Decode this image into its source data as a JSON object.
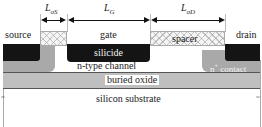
{
  "diagram": {
    "title": "",
    "dimensions": {
      "L_oS": {
        "label": "L",
        "subscript": "oS"
      },
      "L_G": {
        "label": "L",
        "subscript": "G"
      },
      "L_oD": {
        "label": "L",
        "subscript": "oD"
      }
    },
    "terminals": {
      "source": "source",
      "gate": "gate",
      "drain": "drain"
    },
    "layers": {
      "silicide": "silicide",
      "spacer": "spacer",
      "n_contact_prefix": "n",
      "n_contact_sup": "+",
      "n_contact_suffix": " contact",
      "channel": "n-type channel",
      "buried_oxide": "buried oxide",
      "substrate": "silicon substrate"
    },
    "colors": {
      "silicide": "#141414",
      "contact": "#a9a9a9",
      "spacer": "#f4f4f4",
      "buried_oxide": "#e6e6e6",
      "background": "#ffffff"
    }
  }
}
